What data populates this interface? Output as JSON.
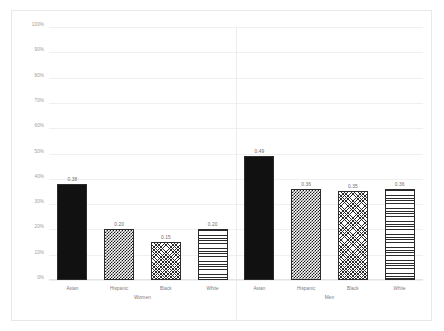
{
  "chart_data": {
    "type": "bar",
    "title": "",
    "subtitle": "",
    "xlabel": "",
    "ylabel": "",
    "ylim": [
      0,
      1
    ],
    "grid": true,
    "legend": "none",
    "y_tick_labels": [
      "100%",
      "90%",
      "80%",
      "70%",
      "60%",
      "50%",
      "40%",
      "30%",
      "20%",
      "10%",
      "0%"
    ],
    "y_tick_values": [
      1.0,
      0.9,
      0.8,
      0.7,
      0.6,
      0.5,
      0.4,
      0.3,
      0.2,
      0.1,
      0.0
    ],
    "categories": [
      "Asian",
      "Hispanic",
      "Black",
      "White"
    ],
    "groups": [
      {
        "name": "Women",
        "bars": [
          {
            "category": "Asian",
            "value": 0.38,
            "label": "0.38",
            "pattern": "solid"
          },
          {
            "category": "Hispanic",
            "value": 0.2,
            "label": "0.20",
            "pattern": "checker"
          },
          {
            "category": "Black",
            "value": 0.15,
            "label": "0.15",
            "pattern": "crosshatch"
          },
          {
            "category": "White",
            "value": 0.2,
            "label": "0.20",
            "pattern": "hlines"
          }
        ]
      },
      {
        "name": "Men",
        "bars": [
          {
            "category": "Asian",
            "value": 0.49,
            "label": "0.49",
            "pattern": "solid"
          },
          {
            "category": "Hispanic",
            "value": 0.36,
            "label": "0.36",
            "pattern": "checker"
          },
          {
            "category": "Black",
            "value": 0.35,
            "label": "0.35",
            "pattern": "crosshatch"
          },
          {
            "category": "White",
            "value": 0.36,
            "label": "0.36",
            "pattern": "hlines"
          }
        ]
      }
    ],
    "colors": {
      "bar_outline": "#2b2b2b",
      "bar_solid": "#111111",
      "gridline": "#f0f0f0",
      "tick_text": "#9b9b9b",
      "label_text": "#7a7a7a",
      "value_text": "#6d6d6d",
      "card_border": "#e8e8e8",
      "background": "#ffffff"
    }
  }
}
